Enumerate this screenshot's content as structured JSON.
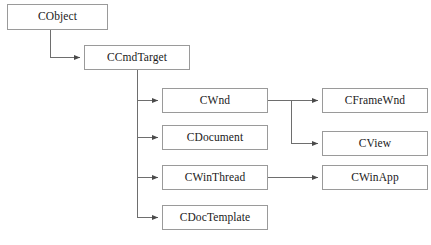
{
  "diagram": {
    "type": "class-hierarchy",
    "style": {
      "box_border_color": "#9a9a9a",
      "box_fill_color": "#ffffff",
      "connector_color": "#6e6e6e",
      "text_color": "#1a1a1a",
      "background_color": "#ffffff"
    },
    "nodes": [
      {
        "id": "cobject",
        "label": "CObject",
        "x": 7,
        "y": 4,
        "w": 101,
        "h": 26
      },
      {
        "id": "ccmdtarget",
        "label": "CCmdTarget",
        "x": 84,
        "y": 45,
        "w": 106,
        "h": 25
      },
      {
        "id": "cwnd",
        "label": "CWnd",
        "x": 162,
        "y": 88,
        "w": 106,
        "h": 25
      },
      {
        "id": "cdocument",
        "label": "CDocument",
        "x": 162,
        "y": 125,
        "w": 106,
        "h": 25
      },
      {
        "id": "cwinthread",
        "label": "CWinThread",
        "x": 162,
        "y": 165,
        "w": 106,
        "h": 25
      },
      {
        "id": "cdoctemplate",
        "label": "CDocTemplate",
        "x": 162,
        "y": 205,
        "w": 106,
        "h": 25
      },
      {
        "id": "cframewnd",
        "label": "CFrameWnd",
        "x": 322,
        "y": 88,
        "w": 106,
        "h": 25
      },
      {
        "id": "cview",
        "label": "CView",
        "x": 322,
        "y": 131,
        "w": 106,
        "h": 25
      },
      {
        "id": "cwinapp",
        "label": "CWinApp",
        "x": 322,
        "y": 165,
        "w": 106,
        "h": 25
      }
    ],
    "edges": [
      {
        "id": "edge-cobject-ccmdtarget",
        "from": "cobject",
        "to": "ccmdtarget",
        "path": "M 50 30 L 50 57.5 L 80 57.5"
      },
      {
        "id": "edge-ccmdtarget-cwnd",
        "from": "ccmdtarget",
        "to": "cwnd",
        "path": "M 137 70 L 137 100.5 L 158 100.5"
      },
      {
        "id": "edge-ccmdtarget-cdocument",
        "from": "ccmdtarget",
        "to": "cdocument",
        "path": "M 137 137.5 L 158 137.5"
      },
      {
        "id": "edge-ccmdtarget-cwinthread",
        "from": "ccmdtarget",
        "to": "cwinthread",
        "path": "M 137 177.5 L 158 177.5"
      },
      {
        "id": "edge-ccmdtarget-cdoctemplate",
        "from": "ccmdtarget",
        "to": "cdoctemplate",
        "path": "M 137 100.5 L 137 217.5 L 158 217.5"
      },
      {
        "id": "edge-cwnd-cframewnd",
        "from": "cwnd",
        "to": "cframewnd",
        "path": "M 268 100.5 L 291 100.5 L 318 100.5"
      },
      {
        "id": "edge-cwnd-cview",
        "from": "cwnd",
        "to": "cview",
        "path": "M 291 100.5 L 291 143.5 L 318 143.5"
      },
      {
        "id": "edge-cwinthread-cwinapp",
        "from": "cwinthread",
        "to": "cwinapp",
        "path": "M 268 177.5 L 318 177.5"
      }
    ]
  }
}
